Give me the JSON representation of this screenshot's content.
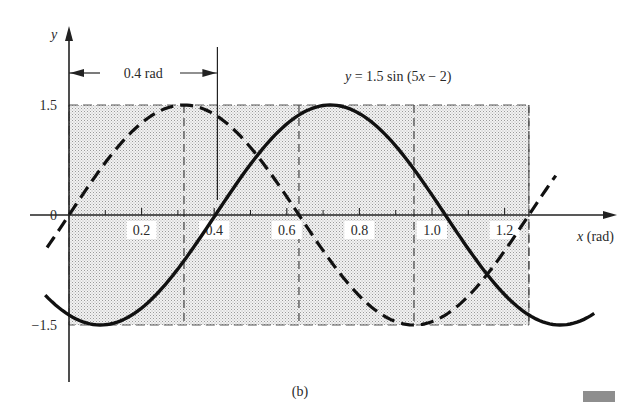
{
  "figure": {
    "caption": "(b)",
    "equation": {
      "lhs": "y",
      "rhs": " = 1.5 sin (5",
      "var": "x",
      "tail": " − 2)"
    },
    "phase_annotation": "0.4 rad",
    "y_axis_label": "y",
    "x_axis_label_var": "x",
    "x_axis_label_unit": " (rad)"
  },
  "chart_data": {
    "type": "line",
    "title": "y = 1.5 sin (5x − 2)",
    "xlabel": "x (rad)",
    "ylabel": "y",
    "xlim": [
      -0.06,
      1.45
    ],
    "ylim": [
      -1.5,
      1.5
    ],
    "x_ticks": [
      0.2,
      0.4,
      0.6,
      0.8,
      1.0,
      1.2
    ],
    "x_tick_labels": [
      "0.2",
      "0.4",
      "0.6",
      "0.8",
      "1.0",
      "1.2"
    ],
    "x_minor_ticks": [
      0.1,
      0.3,
      0.5,
      0.7,
      0.9,
      1.1
    ],
    "y_ticks": [
      1.5,
      0,
      -1.5
    ],
    "y_tick_labels": [
      "1.5",
      "0",
      "-1.5"
    ],
    "grid": false,
    "shaded_region": {
      "x": [
        0,
        1.2566
      ],
      "y": [
        -1.5,
        1.5
      ]
    },
    "reference_vlines": [
      0.3142,
      0.6283,
      0.9425,
      1.2566
    ],
    "phase_marker": {
      "x": 0.4,
      "label": "0.4 rad"
    },
    "series": [
      {
        "name": "y = 1.5 sin(5x)",
        "style": "dashed",
        "amplitude": 1.5,
        "omega": 5,
        "phase": 0,
        "x_range": [
          -0.06,
          1.33
        ],
        "points": [
          [
            0,
            0
          ],
          [
            0.1571,
            1.06
          ],
          [
            0.3142,
            1.5
          ],
          [
            0.4712,
            1.06
          ],
          [
            0.6283,
            0
          ],
          [
            0.7854,
            -1.06
          ],
          [
            0.9425,
            -1.5
          ],
          [
            1.0996,
            -1.06
          ],
          [
            1.2566,
            0
          ]
        ]
      },
      {
        "name": "y = 1.5 sin(5x − 2)",
        "style": "solid",
        "amplitude": 1.5,
        "omega": 5,
        "phase": -2,
        "x_range": [
          -0.065,
          1.435
        ],
        "points": [
          [
            0,
            -1.36
          ],
          [
            0.0858,
            -1.5
          ],
          [
            0.2429,
            -1.06
          ],
          [
            0.4,
            0
          ],
          [
            0.5571,
            1.06
          ],
          [
            0.7142,
            1.5
          ],
          [
            0.8712,
            1.06
          ],
          [
            1.0283,
            0
          ],
          [
            1.1854,
            -1.06
          ],
          [
            1.3425,
            -1.5
          ]
        ]
      }
    ]
  }
}
